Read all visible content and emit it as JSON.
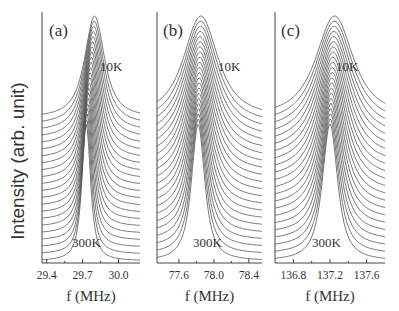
{
  "chart_data": [
    {
      "type": "line",
      "panel_label": "(a)",
      "title": "",
      "xlabel": "f (MHz)",
      "ylabel": "Intensity (arb. unit)",
      "xlim": [
        29.36,
        30.18
      ],
      "xticks": [
        29.4,
        29.7,
        30.0
      ],
      "xtick_labels": [
        "29.4",
        "29.7",
        "30.0"
      ],
      "annotations": [
        "10K",
        "300K"
      ],
      "series_description": "Stacked (offset) NMR spectra from 10K (top) to 300K (bottom)",
      "n_curves": 22,
      "peak_center_top_MHz": 29.8,
      "peak_center_bottom_MHz": 29.73,
      "grid": false
    },
    {
      "type": "line",
      "panel_label": "(b)",
      "title": "",
      "xlabel": "f (MHz)",
      "ylabel": "",
      "xlim": [
        77.35,
        78.55
      ],
      "xticks": [
        77.6,
        78.0,
        78.4
      ],
      "xtick_labels": [
        "77.6",
        "78.0",
        "78.4"
      ],
      "annotations": [
        "10K",
        "300K"
      ],
      "series_description": "Stacked (offset) NMR spectra from 10K (top) to 300K (bottom)",
      "n_curves": 22,
      "peak_center_top_MHz": 77.85,
      "peak_center_bottom_MHz": 77.82,
      "grid": false
    },
    {
      "type": "line",
      "panel_label": "(c)",
      "title": "",
      "xlabel": "f (MHz)",
      "ylabel": "",
      "xlim": [
        136.6,
        137.8
      ],
      "xticks": [
        136.8,
        137.2,
        137.6
      ],
      "xtick_labels": [
        "136.8",
        "137.2",
        "137.6"
      ],
      "annotations": [
        "10K",
        "300K"
      ],
      "series_description": "Stacked (offset) NMR spectra from 10K (top) to 300K (bottom)",
      "n_curves": 22,
      "peak_center_top_MHz": 137.25,
      "peak_center_bottom_MHz": 137.2,
      "grid": false
    }
  ],
  "ylabel": "Intensity (arb. unit)",
  "panels": [
    {
      "label": "(a)",
      "top_temp": "10K",
      "bottom_temp": "300K",
      "xlabel": "f (MHz)",
      "ticks": [
        "29.4",
        "29.7",
        "30.0"
      ]
    },
    {
      "label": "(b)",
      "top_temp": "10K",
      "bottom_temp": "300K",
      "xlabel": "f (MHz)",
      "ticks": [
        "77.6",
        "78.0",
        "78.4"
      ]
    },
    {
      "label": "(c)",
      "top_temp": "10K",
      "bottom_temp": "300K",
      "xlabel": "f (MHz)",
      "ticks": [
        "136.8",
        "137.2",
        "137.6"
      ]
    }
  ],
  "colors": {
    "line": "#555555",
    "axis": "#444444",
    "text": "#333333"
  }
}
